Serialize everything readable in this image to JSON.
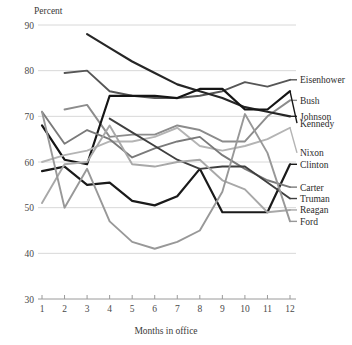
{
  "chart_data": {
    "type": "line",
    "title": "",
    "ylabel": "Percent",
    "xlabel": "Months in office",
    "x": [
      1,
      2,
      3,
      4,
      5,
      6,
      7,
      8,
      9,
      10,
      11,
      12
    ],
    "xtick_labels": [
      "1",
      "2",
      "3",
      "4",
      "5",
      "6",
      "7",
      "8",
      "9",
      "10",
      "11",
      "12"
    ],
    "ytick_labels": [
      "30",
      "40",
      "50",
      "60",
      "70",
      "80",
      "90"
    ],
    "yticks": [
      30,
      40,
      50,
      60,
      70,
      80,
      90
    ],
    "ylim": [
      30,
      90
    ],
    "xlim": [
      0.4,
      12.4
    ],
    "grid": "horizontal",
    "legend": "right-side-inline-labels",
    "series": [
      {
        "name": "Eisenhower",
        "color": "#565656",
        "width": 1.9,
        "label_y": 78.0,
        "values": [
          null,
          79.5,
          80.0,
          75.5,
          74.5,
          74.0,
          74.0,
          74.5,
          75.5,
          77.5,
          76.5,
          78.0
        ]
      },
      {
        "name": "Bush",
        "color": "#8c8c8c",
        "width": 1.9,
        "label_y": 73.5,
        "values": [
          null,
          71.5,
          72.5,
          65.5,
          66.0,
          66.0,
          68.0,
          67.0,
          64.5,
          64.5,
          70.0,
          73.5
        ]
      },
      {
        "name": "Johnson",
        "color": "#262626",
        "width": 2.2,
        "label_y": 70.0,
        "values": [
          null,
          null,
          88.0,
          85.0,
          82.0,
          79.5,
          77.0,
          75.5,
          74.0,
          72.0,
          71.0,
          70.0
        ]
      },
      {
        "name": "Kennedy",
        "color": "#151515",
        "width": 2.2,
        "label_y": 68.5,
        "values": [
          68.0,
          60.5,
          59.5,
          74.5,
          74.5,
          74.5,
          74.0,
          76.0,
          76.0,
          71.5,
          71.5,
          75.5
        ]
      },
      {
        "name": "Nixon",
        "color": "#b4b4b4",
        "width": 1.9,
        "label_y": 62.0,
        "values": [
          60.0,
          61.5,
          62.5,
          64.5,
          64.5,
          65.5,
          67.5,
          63.5,
          62.5,
          63.5,
          65.0,
          67.5
        ]
      },
      {
        "name": "Clinton",
        "color": "#1a1a1a",
        "width": 2.2,
        "label_y": 59.5,
        "values": [
          58.0,
          59.0,
          55.0,
          55.5,
          51.5,
          50.5,
          52.5,
          58.5,
          49.0,
          49.0,
          49.0,
          59.5
        ]
      },
      {
        "name": "Carter",
        "color": "#7a7a7a",
        "width": 1.9,
        "label_y": 54.5,
        "values": [
          71.0,
          64.0,
          67.0,
          65.0,
          61.0,
          63.0,
          64.5,
          65.5,
          61.5,
          58.5,
          56.0,
          54.5
        ]
      },
      {
        "name": "Truman",
        "color": "#3f3f3f",
        "width": 1.9,
        "label_y": 52.0,
        "values": [
          null,
          null,
          null,
          69.5,
          66.5,
          63.5,
          60.5,
          58.5,
          59.0,
          59.0,
          55.5,
          52.0
        ]
      },
      {
        "name": "Reagan",
        "color": "#a8a8a8",
        "width": 1.9,
        "label_y": 49.5,
        "values": [
          51.0,
          59.5,
          60.0,
          68.0,
          59.5,
          59.0,
          60.0,
          60.5,
          56.0,
          54.0,
          49.0,
          49.5
        ]
      },
      {
        "name": "Ford",
        "color": "#989898",
        "width": 1.9,
        "label_y": 47.0,
        "values": [
          71.0,
          50.0,
          58.5,
          47.0,
          42.5,
          41.0,
          42.5,
          45.0,
          53.5,
          70.5,
          62.0,
          47.0
        ]
      }
    ]
  },
  "labels": {
    "percent": "Percent",
    "months": "Months in office"
  }
}
